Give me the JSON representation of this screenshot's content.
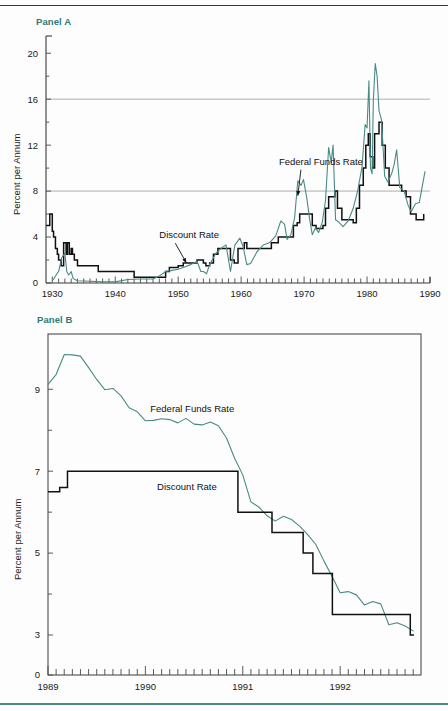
{
  "figure": {
    "panel_a_label": "Panel A",
    "panel_b_label": "Panel B",
    "y_axis_title": "Percent per Annum"
  },
  "chart_data": [
    {
      "type": "line",
      "panel": "Panel A",
      "title": "Panel A",
      "xlabel": "",
      "ylabel": "Percent per Annum",
      "xlim": [
        1929,
        1990
      ],
      "ylim": [
        0,
        21.5
      ],
      "xticks": [
        1930,
        1940,
        1950,
        1960,
        1970,
        1980,
        1990
      ],
      "xtick_labels": [
        "1930",
        "1940",
        "1950",
        "1960",
        "1970",
        "1980",
        "1990"
      ],
      "minor_x_tick_interval": 1,
      "yticks": [
        0,
        4,
        8,
        12,
        16,
        20
      ],
      "ytick_labels": [
        "0",
        "4",
        "8",
        "12",
        "16",
        "20"
      ],
      "minor_y_ticks": [
        2,
        6,
        10,
        14,
        18
      ],
      "gridlines_y": [
        8,
        16
      ],
      "grid": "horizontal-at-8-and-16",
      "legend": "inline annotations with arrows",
      "annotations": [
        {
          "text": "Federal Funds Rate",
          "x": 1966.0,
          "y": 10.3,
          "arrow_to_x": 1969.0,
          "arrow_to_y": 7.6
        },
        {
          "text": "Discount Rate",
          "x": 1947.0,
          "y": 3.9,
          "arrow_to_x": 1951.3,
          "arrow_to_y": 1.75
        }
      ],
      "series": [
        {
          "name": "Discount Rate",
          "color": "#111111",
          "style": "step",
          "x": [
            1929.0,
            1929.6,
            1929.7,
            1930.0,
            1930.2,
            1930.5,
            1930.8,
            1931.0,
            1931.4,
            1931.8,
            1931.9,
            1932.2,
            1932.4,
            1932.7,
            1933.0,
            1933.2,
            1933.5,
            1934.0,
            1934.3,
            1935.0,
            1937.0,
            1937.3,
            1942.5,
            1943.0,
            1946.0,
            1946.5,
            1948.0,
            1948.6,
            1950.0,
            1950.8,
            1953.0,
            1954.0,
            1954.4,
            1955.0,
            1955.6,
            1956.3,
            1957.0,
            1957.8,
            1958.3,
            1958.9,
            1959.5,
            1960.5,
            1960.9,
            1963.5,
            1964.8,
            1965.9,
            1967.2,
            1967.9,
            1968.3,
            1968.9,
            1969.3,
            1970.8,
            1971.3,
            1971.9,
            1973.0,
            1973.4,
            1973.9,
            1974.9,
            1975.3,
            1976.0,
            1977.8,
            1978.3,
            1978.8,
            1979.4,
            1979.8,
            1980.2,
            1980.5,
            1980.9,
            1981.2,
            1981.9,
            1982.4,
            1982.9,
            1983.5,
            1984.4,
            1985.5,
            1986.2,
            1986.9,
            1987.8,
            1988.5,
            1989.0
          ],
          "y": [
            5.0,
            6.0,
            6.0,
            4.5,
            4.0,
            3.0,
            2.5,
            2.0,
            1.5,
            3.5,
            3.5,
            2.5,
            3.5,
            2.5,
            3.0,
            2.5,
            2.0,
            1.5,
            1.5,
            1.5,
            1.5,
            1.0,
            1.0,
            0.5,
            0.5,
            0.5,
            1.0,
            1.34,
            1.5,
            1.75,
            2.0,
            1.75,
            1.5,
            1.75,
            2.5,
            3.0,
            3.0,
            3.0,
            2.0,
            1.75,
            3.0,
            3.5,
            3.0,
            3.0,
            3.5,
            4.0,
            4.0,
            4.0,
            5.0,
            5.25,
            6.0,
            6.0,
            5.0,
            4.75,
            5.0,
            6.5,
            7.5,
            8.0,
            6.5,
            5.5,
            5.25,
            6.5,
            8.5,
            10.0,
            12.0,
            13.0,
            11.0,
            10.0,
            13.0,
            14.0,
            12.0,
            10.0,
            8.5,
            8.5,
            8.0,
            7.5,
            6.0,
            5.5,
            5.5,
            6.0,
            7.0
          ]
        },
        {
          "name": "Federal Funds Rate",
          "color": "#4a8a85",
          "style": "line",
          "x": [
            1930.0,
            1931.0,
            1931.5,
            1932.0,
            1932.3,
            1932.6,
            1933.0,
            1933.3,
            1933.6,
            1934.0,
            1936.0,
            1938.0,
            1940.0,
            1942.0,
            1944.0,
            1946.0,
            1947.0,
            1948.0,
            1949.0,
            1950.0,
            1951.0,
            1952.0,
            1953.0,
            1953.6,
            1954.0,
            1954.5,
            1955.0,
            1956.0,
            1957.0,
            1957.6,
            1958.3,
            1959.0,
            1959.8,
            1960.3,
            1960.9,
            1961.5,
            1962.5,
            1963.5,
            1964.5,
            1965.5,
            1966.3,
            1966.9,
            1967.3,
            1967.9,
            1968.5,
            1969.0,
            1969.5,
            1969.9,
            1970.4,
            1970.9,
            1971.3,
            1971.8,
            1972.3,
            1972.9,
            1973.4,
            1973.9,
            1974.3,
            1974.6,
            1975.0,
            1975.5,
            1976.2,
            1977.0,
            1977.8,
            1978.5,
            1979.2,
            1979.7,
            1980.0,
            1980.3,
            1980.55,
            1980.8,
            1981.0,
            1981.3,
            1981.6,
            1981.9,
            1982.3,
            1982.8,
            1983.3,
            1983.9,
            1984.3,
            1984.7,
            1985.2,
            1985.9,
            1986.5,
            1987.0,
            1987.7,
            1988.3,
            1988.8,
            1989.2
          ],
          "y": [
            0.2,
            1.0,
            2.2,
            2.6,
            1.0,
            0.7,
            1.0,
            0.4,
            0.3,
            0.2,
            0.15,
            0.1,
            0.1,
            0.3,
            0.35,
            0.35,
            0.6,
            1.0,
            1.1,
            1.2,
            1.4,
            1.6,
            1.9,
            1.0,
            1.0,
            0.8,
            1.6,
            2.6,
            3.1,
            3.3,
            1.0,
            3.3,
            3.9,
            3.2,
            1.6,
            1.7,
            2.7,
            3.3,
            3.5,
            4.1,
            5.4,
            5.1,
            3.8,
            4.2,
            5.7,
            8.9,
            8.5,
            9.0,
            7.5,
            5.5,
            4.2,
            4.8,
            4.4,
            5.3,
            7.2,
            11.8,
            10.5,
            12.0,
            5.5,
            5.3,
            4.9,
            5.4,
            6.5,
            8.0,
            10.1,
            13.8,
            13.5,
            17.6,
            10.0,
            9.5,
            15.9,
            19.1,
            18.0,
            15.0,
            14.2,
            9.3,
            8.8,
            9.5,
            10.3,
            11.6,
            8.3,
            8.0,
            6.8,
            6.2,
            6.9,
            7.0,
            8.5,
            9.7
          ]
        }
      ]
    },
    {
      "type": "line",
      "panel": "Panel B",
      "title": "Panel B",
      "xlabel": "",
      "ylabel": "Percent per Annum",
      "xlim": [
        1989.0,
        1992.83
      ],
      "ylim": [
        0,
        10.35
      ],
      "y_axis_break": "0 to 3 compressed / broken axis",
      "xticks": [
        1989,
        1990,
        1991,
        1992
      ],
      "xtick_labels": [
        "1989",
        "1990",
        "1991",
        "1992"
      ],
      "minor_x_tick_interval": 0.0833,
      "yticks": [
        0,
        3,
        5,
        7,
        9
      ],
      "ytick_labels": [
        "0",
        "3",
        "5",
        "7",
        "9"
      ],
      "minor_y_ticks": [
        4,
        6,
        8
      ],
      "grid": "off",
      "legend": "inline labels",
      "annotations": [
        {
          "text": "Federal Funds Rate",
          "x": 1990.05,
          "y": 8.45
        },
        {
          "text": "Discount Rate",
          "x": 1990.12,
          "y": 6.55
        }
      ],
      "series": [
        {
          "name": "Federal Funds Rate",
          "color": "#4a8a85",
          "style": "line",
          "x": [
            1989.0,
            1989.083,
            1989.167,
            1989.25,
            1989.333,
            1989.417,
            1989.5,
            1989.583,
            1989.667,
            1989.75,
            1989.833,
            1989.917,
            1990.0,
            1990.083,
            1990.167,
            1990.25,
            1990.333,
            1990.417,
            1990.5,
            1990.583,
            1990.667,
            1990.75,
            1990.833,
            1990.917,
            1991.0,
            1991.083,
            1991.167,
            1991.25,
            1991.333,
            1991.417,
            1991.5,
            1991.583,
            1991.667,
            1991.75,
            1991.833,
            1991.917,
            1992.0,
            1992.083,
            1992.167,
            1992.25,
            1992.333,
            1992.417,
            1992.5,
            1992.583,
            1992.667,
            1992.75
          ],
          "y": [
            9.12,
            9.36,
            9.85,
            9.84,
            9.81,
            9.53,
            9.24,
            8.99,
            9.02,
            8.84,
            8.55,
            8.45,
            8.23,
            8.24,
            8.28,
            8.26,
            8.18,
            8.29,
            8.15,
            8.13,
            8.2,
            8.11,
            7.81,
            7.31,
            6.91,
            6.25,
            6.12,
            5.91,
            5.78,
            5.9,
            5.82,
            5.66,
            5.45,
            5.21,
            4.81,
            4.43,
            4.03,
            4.06,
            3.98,
            3.73,
            3.82,
            3.76,
            3.25,
            3.3,
            3.22,
            3.1
          ]
        },
        {
          "name": "Discount Rate",
          "color": "#111111",
          "style": "step",
          "x": [
            1989.0,
            1989.12,
            1989.2,
            1990.83,
            1990.95,
            1991.1,
            1991.3,
            1991.42,
            1991.62,
            1991.72,
            1991.92,
            1992.0,
            1992.62,
            1992.72,
            1992.75
          ],
          "y": [
            6.5,
            6.6,
            7.0,
            7.0,
            6.0,
            6.0,
            5.5,
            5.5,
            5.0,
            4.5,
            3.5,
            3.5,
            3.5,
            3.0,
            2.95
          ]
        }
      ]
    }
  ]
}
